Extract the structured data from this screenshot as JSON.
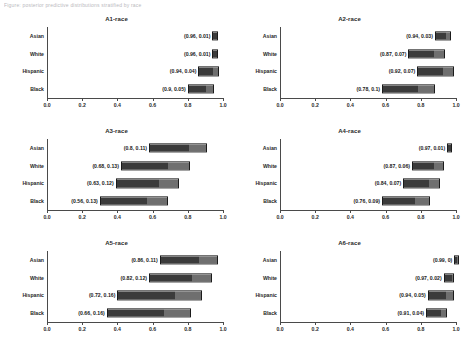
{
  "topnote": "Figure: posterior predictive distributions stratified by race",
  "chart_data": {
    "type": "bar",
    "layout": {
      "rows": 3,
      "cols": 2,
      "orientation": "horizontal",
      "grid": false,
      "legend": "none",
      "xlim": [
        0.0,
        1.0
      ]
    },
    "categories": [
      "Asian",
      "White",
      "Hispanic",
      "Black"
    ],
    "xticks": [
      "0.0",
      "0.2",
      "0.4",
      "0.6",
      "0.8",
      "1.0"
    ],
    "xtickvals": [
      0.0,
      0.2,
      0.4,
      0.6,
      0.8,
      1.0
    ],
    "xlabel": "",
    "ylabel": "",
    "colors": {
      "segment1": "#3b3b3b",
      "segment2": "#6f6f6f",
      "axis": "#4a4a4a"
    },
    "panels": [
      {
        "title": "A1-race",
        "series": [
          {
            "category": "Asian",
            "values": [
              0.96,
              0.01
            ],
            "label": "(0.96, 0.01)"
          },
          {
            "category": "White",
            "values": [
              0.96,
              0.01
            ],
            "label": "(0.96, 0.01)"
          },
          {
            "category": "Hispanic",
            "values": [
              0.94,
              0.04
            ],
            "label": "(0.94, 0.04)"
          },
          {
            "category": "Black",
            "values": [
              0.9,
              0.05
            ],
            "label": "(0.9, 0.05)"
          }
        ]
      },
      {
        "title": "A2-race",
        "series": [
          {
            "category": "Asian",
            "values": [
              0.94,
              0.03
            ],
            "label": "(0.94, 0.03)"
          },
          {
            "category": "White",
            "values": [
              0.87,
              0.07
            ],
            "label": "(0.87, 0.07)"
          },
          {
            "category": "Hispanic",
            "values": [
              0.92,
              0.07
            ],
            "label": "(0.92, 0.07)"
          },
          {
            "category": "Black",
            "values": [
              0.78,
              0.1
            ],
            "label": "(0.78, 0.1)"
          }
        ]
      },
      {
        "title": "A3-race",
        "series": [
          {
            "category": "Asian",
            "values": [
              0.8,
              0.11
            ],
            "label": "(0.8, 0.11)"
          },
          {
            "category": "White",
            "values": [
              0.68,
              0.13
            ],
            "label": "(0.68, 0.13)"
          },
          {
            "category": "Hispanic",
            "values": [
              0.63,
              0.12
            ],
            "label": "(0.63, 0.12)"
          },
          {
            "category": "Black",
            "values": [
              0.56,
              0.13
            ],
            "label": "(0.56, 0.13)"
          }
        ]
      },
      {
        "title": "A4-race",
        "series": [
          {
            "category": "Asian",
            "values": [
              0.97,
              0.01
            ],
            "label": "(0.97, 0.01)"
          },
          {
            "category": "White",
            "values": [
              0.87,
              0.06
            ],
            "label": "(0.87, 0.06)"
          },
          {
            "category": "Hispanic",
            "values": [
              0.84,
              0.07
            ],
            "label": "(0.84, 0.07)"
          },
          {
            "category": "Black",
            "values": [
              0.76,
              0.09
            ],
            "label": "(0.76, 0.09)"
          }
        ]
      },
      {
        "title": "A5-race",
        "series": [
          {
            "category": "Asian",
            "values": [
              0.86,
              0.11
            ],
            "label": "(0.86, 0.11)"
          },
          {
            "category": "White",
            "values": [
              0.82,
              0.12
            ],
            "label": "(0.82, 0.12)"
          },
          {
            "category": "Hispanic",
            "values": [
              0.72,
              0.16
            ],
            "label": "(0.72, 0.16)"
          },
          {
            "category": "Black",
            "values": [
              0.66,
              0.16
            ],
            "label": "(0.66, 0.16)"
          }
        ]
      },
      {
        "title": "A6-race",
        "series": [
          {
            "category": "Asian",
            "values": [
              0.99,
              0.0
            ],
            "label": "(0.99, 0)"
          },
          {
            "category": "White",
            "values": [
              0.97,
              0.02
            ],
            "label": "(0.97, 0.02)"
          },
          {
            "category": "Hispanic",
            "values": [
              0.94,
              0.05
            ],
            "label": "(0.94, 0.05)"
          },
          {
            "category": "Black",
            "values": [
              0.91,
              0.04
            ],
            "label": "(0.91, 0.04)"
          }
        ]
      }
    ]
  }
}
